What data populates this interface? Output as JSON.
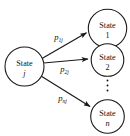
{
  "diagram": {
    "background_color": "#ffffff",
    "stroke_color": "#1a1a1a",
    "text_color": "#111111",
    "source_node": {
      "id": "state-j",
      "line1": "State",
      "line2": "j",
      "cx": 24.5,
      "cy": 66.5,
      "r": 19.5
    },
    "target_nodes": [
      {
        "id": "state-1",
        "line1": "State",
        "line2": "1",
        "cx": 107.5,
        "cy": 28.5,
        "r": 19.5
      },
      {
        "id": "state-2",
        "line1": "State",
        "line2": "2",
        "cx": 107.5,
        "cy": 60.0,
        "r": 16.5
      },
      {
        "id": "state-n",
        "line1": "State",
        "line2": "n",
        "cx": 107.5,
        "cy": 116.5,
        "r": 17.0
      }
    ],
    "ellipsis": {
      "id": "vertical-ellipsis",
      "glyph": "⋮",
      "cx": 107.5,
      "dots": 3
    },
    "edges": [
      {
        "id": "edge-p1j",
        "label_base": "p",
        "label_sub": "1j",
        "from": "state-j",
        "to": "state-1",
        "x1": 42.0,
        "y1": 58.5,
        "x2": 87.5,
        "y2": 32.5,
        "label_x": 58.5,
        "label_y": 39.5
      },
      {
        "id": "edge-p2j",
        "label_base": "p",
        "label_sub": "2j",
        "from": "state-j",
        "to": "state-2",
        "x1": 43.5,
        "y1": 63.0,
        "x2": 89.0,
        "y2": 59.0,
        "label_x": 64.5,
        "label_y": 72.0
      },
      {
        "id": "edge-pnj",
        "label_base": "p",
        "label_sub": "nj",
        "from": "state-j",
        "to": "state-n",
        "x1": 41.0,
        "y1": 76.0,
        "x2": 91.0,
        "y2": 107.0,
        "label_x": 62.5,
        "label_y": 101.0
      }
    ]
  }
}
